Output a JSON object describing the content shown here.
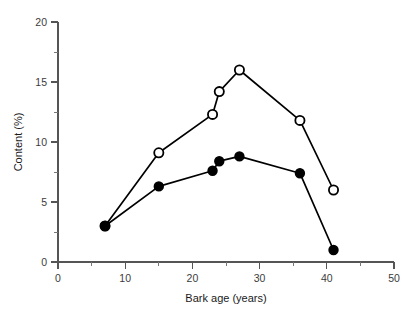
{
  "chart_data": {
    "type": "line",
    "title": "",
    "xlabel": "Bark age (years)",
    "ylabel": "Content (%)",
    "xlim": [
      0,
      50
    ],
    "ylim": [
      0,
      20
    ],
    "x_ticks": [
      0,
      10,
      20,
      30,
      40,
      50
    ],
    "x_tick_labels": [
      "0",
      "10",
      "20",
      "30",
      "40",
      "50"
    ],
    "x_minor_ticks": [
      5,
      15,
      25,
      35,
      45
    ],
    "y_ticks": [
      0,
      5,
      10,
      15,
      20
    ],
    "y_tick_labels": [
      "0",
      "5",
      "10",
      "15",
      "20"
    ],
    "y_minor_ticks": [
      2.5,
      7.5,
      12.5,
      17.5
    ],
    "grid": false,
    "legend_position": "none",
    "series": [
      {
        "name": "open-circle-series",
        "marker": "open-circle",
        "color": "#000000",
        "x": [
          7,
          15,
          23,
          24,
          27,
          36,
          41
        ],
        "values": [
          3.0,
          9.1,
          12.3,
          14.2,
          16.0,
          11.8,
          6.0
        ]
      },
      {
        "name": "filled-circle-series",
        "marker": "filled-circle",
        "color": "#000000",
        "x": [
          7,
          15,
          23,
          24,
          27,
          36,
          41
        ],
        "values": [
          3.0,
          6.3,
          7.6,
          8.4,
          8.8,
          7.4,
          1.0
        ]
      }
    ]
  },
  "figure": {
    "background_color": "#ffffff",
    "axis_color": "#555555",
    "line_color": "#000000"
  }
}
